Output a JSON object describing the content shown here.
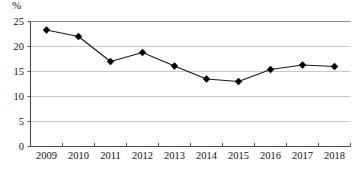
{
  "chart_data": {
    "type": "line",
    "title": "",
    "subtitle": "",
    "xlabel": "",
    "ylabel": "",
    "unit_label": "%",
    "categories": [
      "2009",
      "2010",
      "2011",
      "2012",
      "2013",
      "2014",
      "2015",
      "2016",
      "2017",
      "2018"
    ],
    "values": [
      23.3,
      22.0,
      17.0,
      18.8,
      16.1,
      13.5,
      13.0,
      15.4,
      16.3,
      16.0
    ],
    "series": [
      {
        "name": "",
        "values": [
          23.3,
          22.0,
          17.0,
          18.8,
          16.1,
          13.5,
          13.0,
          15.4,
          16.3,
          16.0
        ]
      }
    ],
    "ylim": [
      0,
      25
    ],
    "yticks": [
      0,
      5,
      10,
      15,
      20,
      25
    ],
    "ytick_labels": [
      "0",
      "5",
      "10",
      "15",
      "20",
      "25"
    ],
    "grid": true,
    "grid_axis": "y",
    "legend": false,
    "legend_position": "none",
    "marker": "diamond",
    "line_color": "#1a1a1a",
    "marker_color": "#000000",
    "grid_color": "#c9c9c9",
    "axis_color": "#555555",
    "background": "#ffffff"
  },
  "caption": {
    "partial_text": ""
  }
}
